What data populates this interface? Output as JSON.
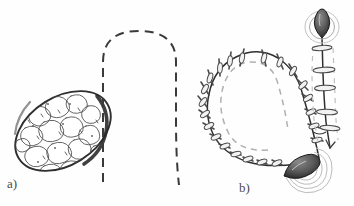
{
  "figure": {
    "background_color": "#fefefe",
    "ink_color": "#3a3a3a",
    "light_ink_color": "#9a9a9a",
    "fill_color": "#6e6e6e",
    "width": 354,
    "height": 206
  },
  "panels": [
    {
      "id": "a",
      "label": "a)",
      "caption_position": "bottom-left",
      "elements": [
        {
          "name": "tumor-mass",
          "description": "lobulated oval tissue mass, tilted ellipse",
          "center_x": 63,
          "center_y": 131,
          "radius_x": 52,
          "radius_y": 34,
          "rotation_deg": -32,
          "texture": "lobulated"
        },
        {
          "name": "incision-dashed-line",
          "description": "inverted U shaped dashed incision marking",
          "style": "dashed",
          "apex_y": 31,
          "left_x": 103,
          "right_x": 176,
          "bottom_y": 185
        }
      ]
    },
    {
      "id": "b",
      "label": "b)",
      "caption_position": "bottom-center",
      "elements": [
        {
          "name": "sutured-incision",
          "description": "horseshoe shaped closed incision with interrupted sutures",
          "suture_count": 22,
          "inner_line_style": "dashed"
        },
        {
          "name": "vertical-sutured-line",
          "description": "vertical closure line at right with cross sutures",
          "suture_count": 5
        },
        {
          "name": "drain-knot-upper",
          "description": "dark teardrop suture knot with surrounding loop",
          "center_x": 322,
          "center_y": 28
        },
        {
          "name": "drain-knot-lower",
          "description": "dark teardrop suture knot with radiating puckering lines",
          "center_x": 301,
          "center_y": 170
        }
      ]
    }
  ]
}
